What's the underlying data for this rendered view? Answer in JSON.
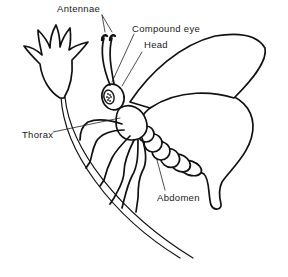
{
  "diagram": {
    "labels": {
      "antennae": "Antennae",
      "compound_eye": "Compound eye",
      "head": "Head",
      "thorax": "Thorax",
      "abdomen": "Abdomen"
    },
    "colors": {
      "ink": "#111111",
      "background": "#ffffff"
    }
  }
}
